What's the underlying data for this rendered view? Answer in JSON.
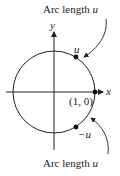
{
  "diagram": {
    "top_label": {
      "text": "Arc length ",
      "var": "u"
    },
    "bottom_label": {
      "text": "Arc length ",
      "var": "u"
    },
    "axis_x": "x",
    "axis_y": "y",
    "point_upper": "u",
    "point_lower": "−u",
    "point_origin": "(1, 0)",
    "stroke_color": "#222222"
  }
}
